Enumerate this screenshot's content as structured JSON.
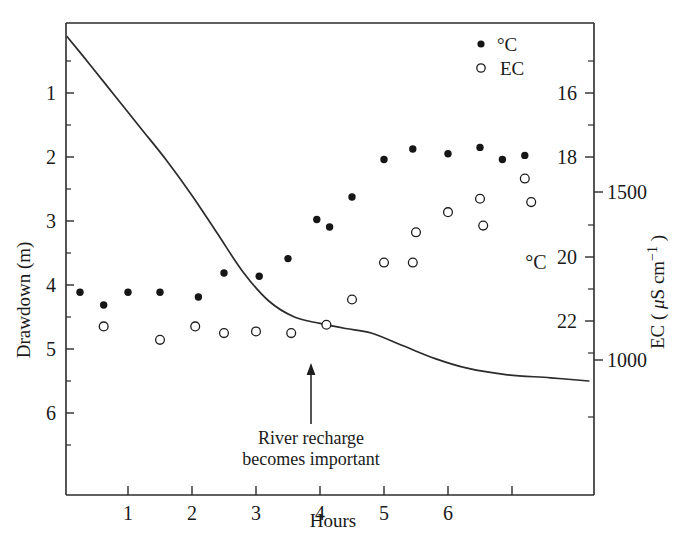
{
  "chart_data": {
    "type": "scatter",
    "title": "",
    "xlabel": "Hours",
    "ylabel": "Drawdown (m)",
    "y2label_ec": "EC ( μS cm⁻¹ )",
    "y2label_temp": "°C",
    "grid": false,
    "legend_position": "top-right",
    "xlim": [
      0,
      8.25
    ],
    "xticks": [
      1,
      2,
      3,
      4,
      5,
      6
    ],
    "xtick_labels": [
      "1",
      "2",
      "3",
      "4",
      "5",
      "6"
    ],
    "xtick_unlabeled": [
      7
    ],
    "drawdown_axis": {
      "label": "Drawdown (m)",
      "ticks": [
        1,
        2,
        3,
        4,
        5,
        6
      ],
      "tick_labels": [
        "1",
        "2",
        "3",
        "4",
        "5",
        "6"
      ],
      "range": [
        0.1,
        7.3
      ],
      "inverted": true,
      "unit": "m"
    },
    "temperature_axis": {
      "label": "°C",
      "ticks": [
        16,
        18,
        20,
        22
      ],
      "tick_labels": [
        "16",
        "18",
        "20",
        "22"
      ],
      "unit": "°C"
    },
    "ec_axis": {
      "label": "EC ( μS cm⁻¹ )",
      "ticks": [
        1500,
        1000
      ],
      "tick_labels": [
        "1500",
        "1000"
      ],
      "unit": "μS cm⁻¹"
    },
    "series": [
      {
        "name": "°C",
        "marker": "filled-circle",
        "color": "#161616",
        "axis": "temperature",
        "points": [
          {
            "x": 0.25,
            "y": 21.1
          },
          {
            "x": 0.62,
            "y": 21.5
          },
          {
            "x": 1.0,
            "y": 21.1
          },
          {
            "x": 1.5,
            "y": 21.1
          },
          {
            "x": 2.1,
            "y": 21.25
          },
          {
            "x": 2.5,
            "y": 20.5
          },
          {
            "x": 3.05,
            "y": 20.6
          },
          {
            "x": 3.5,
            "y": 20.05
          },
          {
            "x": 3.95,
            "y": 19.25
          },
          {
            "x": 4.15,
            "y": 19.4
          },
          {
            "x": 4.5,
            "y": 18.8
          },
          {
            "x": 5.0,
            "y": 18.05
          },
          {
            "x": 5.45,
            "y": 17.75
          },
          {
            "x": 6.0,
            "y": 17.9
          },
          {
            "x": 6.5,
            "y": 17.7
          },
          {
            "x": 6.85,
            "y": 18.05
          },
          {
            "x": 7.2,
            "y": 17.95
          }
        ]
      },
      {
        "name": "EC",
        "marker": "open-circle",
        "color": "#1d1d1d",
        "axis": "ec",
        "points": [
          {
            "x": 0.62,
            "y": 1100
          },
          {
            "x": 1.5,
            "y": 1060
          },
          {
            "x": 2.05,
            "y": 1100
          },
          {
            "x": 2.5,
            "y": 1080
          },
          {
            "x": 3.0,
            "y": 1085
          },
          {
            "x": 3.55,
            "y": 1080
          },
          {
            "x": 4.1,
            "y": 1105
          },
          {
            "x": 4.5,
            "y": 1180
          },
          {
            "x": 5.0,
            "y": 1290
          },
          {
            "x": 5.45,
            "y": 1290
          },
          {
            "x": 5.5,
            "y": 1380
          },
          {
            "x": 6.0,
            "y": 1440
          },
          {
            "x": 6.5,
            "y": 1480
          },
          {
            "x": 6.55,
            "y": 1400
          },
          {
            "x": 7.2,
            "y": 1540
          },
          {
            "x": 7.3,
            "y": 1470
          }
        ]
      },
      {
        "name": "Drawdown curve",
        "marker": "line",
        "color": "#2b2b2b",
        "axis": "drawdown",
        "points": [
          {
            "x": 0.05,
            "y": 0.12
          },
          {
            "x": 0.4,
            "y": 0.55
          },
          {
            "x": 0.8,
            "y": 1.05
          },
          {
            "x": 1.2,
            "y": 1.55
          },
          {
            "x": 1.6,
            "y": 2.05
          },
          {
            "x": 2.0,
            "y": 2.6
          },
          {
            "x": 2.4,
            "y": 3.2
          },
          {
            "x": 2.8,
            "y": 3.8
          },
          {
            "x": 3.2,
            "y": 4.25
          },
          {
            "x": 3.6,
            "y": 4.5
          },
          {
            "x": 4.0,
            "y": 4.6
          },
          {
            "x": 4.4,
            "y": 4.68
          },
          {
            "x": 4.8,
            "y": 4.75
          },
          {
            "x": 5.3,
            "y": 4.95
          },
          {
            "x": 5.8,
            "y": 5.15
          },
          {
            "x": 6.3,
            "y": 5.3
          },
          {
            "x": 6.9,
            "y": 5.4
          },
          {
            "x": 7.6,
            "y": 5.45
          },
          {
            "x": 8.2,
            "y": 5.5
          }
        ]
      }
    ],
    "annotations": [
      {
        "name": "river-recharge-note",
        "line1": "River recharge",
        "line2": "becomes important",
        "arrow_target_x": 3.85,
        "arrow_target_y_m": 4.6
      }
    ],
    "legend": [
      {
        "label": "°C",
        "marker": "filled-circle"
      },
      {
        "label": "EC",
        "marker": "open-circle"
      }
    ]
  }
}
